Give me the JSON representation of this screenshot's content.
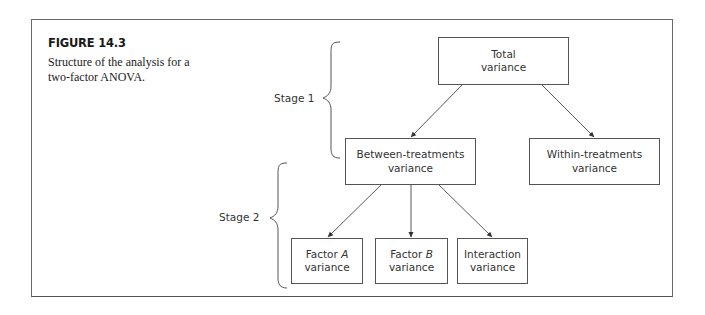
{
  "figure": {
    "label": "FIGURE 14.3",
    "caption": "Structure of the analysis for a two-factor ANOVA."
  },
  "stages": [
    {
      "label": "Stage 1"
    },
    {
      "label": "Stage 2"
    }
  ],
  "nodes": {
    "total": {
      "line1": "Total",
      "line2": "variance"
    },
    "between": {
      "line1": "Between-treatments",
      "line2": "variance"
    },
    "within": {
      "line1": "Within-treatments",
      "line2": "variance"
    },
    "factor_a": {
      "prefix": "Factor ",
      "italic": "A",
      "line2": "variance"
    },
    "factor_b": {
      "prefix": "Factor ",
      "italic": "B",
      "line2": "variance"
    },
    "interaction": {
      "line1": "Interaction",
      "line2": "variance"
    }
  },
  "edges": [
    {
      "from": "total",
      "to": "between"
    },
    {
      "from": "total",
      "to": "within"
    },
    {
      "from": "between",
      "to": "factor_a"
    },
    {
      "from": "between",
      "to": "factor_b"
    },
    {
      "from": "between",
      "to": "interaction"
    }
  ]
}
